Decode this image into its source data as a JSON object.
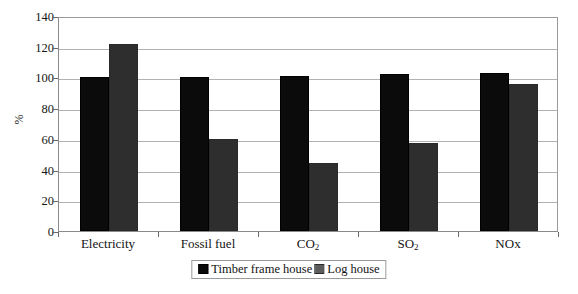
{
  "chart_data": {
    "type": "bar",
    "title": "",
    "xlabel": "",
    "ylabel": "%",
    "ylim": [
      0,
      140
    ],
    "yticks": [
      0,
      20,
      40,
      60,
      80,
      100,
      120,
      140
    ],
    "ytick_labels": [
      "0",
      "20",
      "40",
      "60",
      "80",
      "100",
      "120",
      "140"
    ],
    "grid": true,
    "legend_position": "bottom-center",
    "categories": [
      "Electricity",
      "Fossil fuel",
      "CO2",
      "SO2",
      "NOx"
    ],
    "category_labels_html": [
      "Electricity",
      "Fossil fuel",
      "CO<sub>2</sub>",
      "SO<sub>2</sub>",
      "NOx"
    ],
    "series": [
      {
        "name": "Timber frame house",
        "color": "#0b0b0b",
        "fill": "solid-black",
        "values": [
          100,
          100,
          101,
          102,
          103
        ]
      },
      {
        "name": "Log house",
        "color": "#2e2e2e",
        "fill": "cross-hatch",
        "values": [
          122,
          60,
          44,
          57,
          96
        ]
      }
    ]
  },
  "legend": {
    "entries": [
      {
        "label": "Timber frame house"
      },
      {
        "label": "Log house"
      }
    ]
  },
  "axis": {
    "y_title": "%"
  }
}
